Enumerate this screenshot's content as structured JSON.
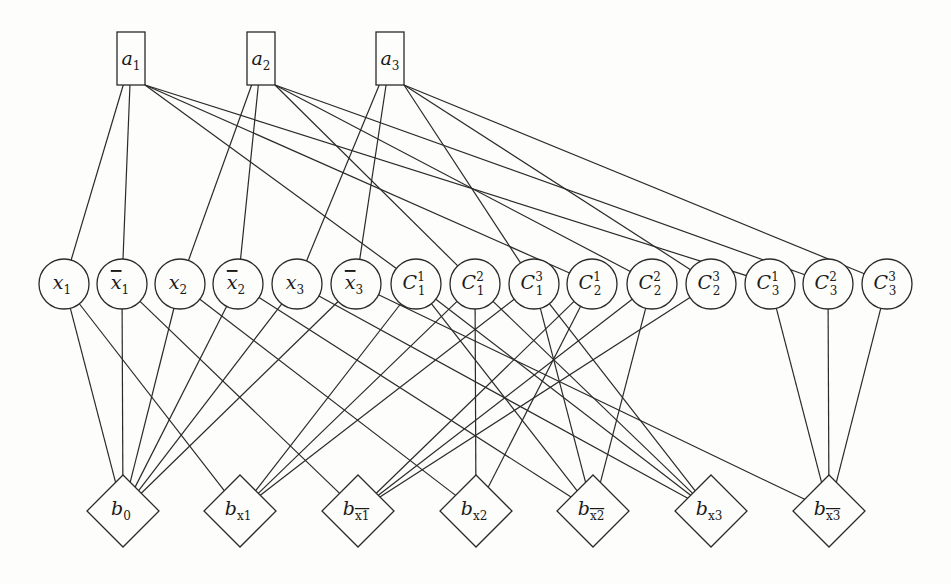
{
  "diagram": {
    "type": "graph",
    "colors": {
      "stroke": "#2a2a2a",
      "background": "#fdfdfb",
      "text": "#1a1a1a"
    },
    "top_nodes": [
      {
        "id": "a1",
        "base": "a",
        "sub": "1",
        "bar": false,
        "x": 131,
        "y": 59
      },
      {
        "id": "a2",
        "base": "a",
        "sub": "2",
        "bar": false,
        "x": 261,
        "y": 59
      },
      {
        "id": "a3",
        "base": "a",
        "sub": "3",
        "bar": false,
        "x": 390,
        "y": 59
      }
    ],
    "middle_nodes": [
      {
        "id": "x1",
        "base": "x",
        "sub": "1",
        "sup": "",
        "bar": false,
        "x": 64
      },
      {
        "id": "nx1",
        "base": "x",
        "sub": "1",
        "sup": "",
        "bar": true,
        "x": 122
      },
      {
        "id": "x2",
        "base": "x",
        "sub": "2",
        "sup": "",
        "bar": false,
        "x": 180
      },
      {
        "id": "nx2",
        "base": "x",
        "sub": "2",
        "sup": "",
        "bar": true,
        "x": 238
      },
      {
        "id": "x3",
        "base": "x",
        "sub": "3",
        "sup": "",
        "bar": false,
        "x": 297
      },
      {
        "id": "nx3",
        "base": "x",
        "sub": "3",
        "sup": "",
        "bar": true,
        "x": 356
      },
      {
        "id": "C11",
        "base": "C",
        "sub": "1",
        "sup": "1",
        "bar": false,
        "x": 416
      },
      {
        "id": "C12",
        "base": "C",
        "sub": "1",
        "sup": "2",
        "bar": false,
        "x": 475
      },
      {
        "id": "C13",
        "base": "C",
        "sub": "1",
        "sup": "3",
        "bar": false,
        "x": 534
      },
      {
        "id": "C21",
        "base": "C",
        "sub": "2",
        "sup": "1",
        "bar": false,
        "x": 592
      },
      {
        "id": "C22",
        "base": "C",
        "sub": "2",
        "sup": "2",
        "bar": false,
        "x": 652
      },
      {
        "id": "C23",
        "base": "C",
        "sub": "2",
        "sup": "3",
        "bar": false,
        "x": 711
      },
      {
        "id": "C31",
        "base": "C",
        "sub": "3",
        "sup": "1",
        "bar": false,
        "x": 770
      },
      {
        "id": "C32",
        "base": "C",
        "sub": "3",
        "sup": "2",
        "bar": false,
        "x": 828
      },
      {
        "id": "C33",
        "base": "C",
        "sub": "3",
        "sup": "3",
        "bar": false,
        "x": 887
      }
    ],
    "middle_y": 284,
    "bottom_nodes": [
      {
        "id": "b0",
        "base": "b",
        "sub": "0",
        "bar": false,
        "x": 123
      },
      {
        "id": "bx1",
        "base": "b",
        "sub": "x1",
        "bar": false,
        "x": 240
      },
      {
        "id": "bnx1",
        "base": "b",
        "sub": "x1",
        "bar": true,
        "x": 358
      },
      {
        "id": "bx2",
        "base": "b",
        "sub": "x2",
        "bar": false,
        "x": 476
      },
      {
        "id": "bnx2",
        "base": "b",
        "sub": "x2",
        "bar": true,
        "x": 593
      },
      {
        "id": "bx3",
        "base": "b",
        "sub": "x3",
        "bar": false,
        "x": 711
      },
      {
        "id": "bnx3",
        "base": "b",
        "sub": "x3",
        "bar": true,
        "x": 829
      }
    ],
    "bottom_y": 511,
    "edges": [
      [
        "a1",
        "x1"
      ],
      [
        "a1",
        "nx1"
      ],
      [
        "a1",
        "C11"
      ],
      [
        "a1",
        "C21"
      ],
      [
        "a1",
        "C31"
      ],
      [
        "a2",
        "x2"
      ],
      [
        "a2",
        "nx2"
      ],
      [
        "a2",
        "C12"
      ],
      [
        "a2",
        "C22"
      ],
      [
        "a2",
        "C32"
      ],
      [
        "a3",
        "x3"
      ],
      [
        "a3",
        "nx3"
      ],
      [
        "a3",
        "C13"
      ],
      [
        "a3",
        "C23"
      ],
      [
        "a3",
        "C33"
      ],
      [
        "x1",
        "b0"
      ],
      [
        "nx1",
        "b0"
      ],
      [
        "x2",
        "b0"
      ],
      [
        "nx2",
        "b0"
      ],
      [
        "x3",
        "b0"
      ],
      [
        "nx3",
        "b0"
      ],
      [
        "x1",
        "bx1"
      ],
      [
        "nx1",
        "bnx1"
      ],
      [
        "x2",
        "bx2"
      ],
      [
        "nx2",
        "bnx2"
      ],
      [
        "x3",
        "bx3"
      ],
      [
        "nx3",
        "bnx3"
      ],
      [
        "C11",
        "bx1"
      ],
      [
        "C12",
        "bx1"
      ],
      [
        "C13",
        "bx1"
      ],
      [
        "C21",
        "bnx1"
      ],
      [
        "C22",
        "bnx1"
      ],
      [
        "C23",
        "bnx1"
      ],
      [
        "C12",
        "bx2"
      ],
      [
        "C21",
        "bx2"
      ],
      [
        "C11",
        "bnx2"
      ],
      [
        "C13",
        "bnx2"
      ],
      [
        "C22",
        "bnx2"
      ],
      [
        "C11",
        "bx3"
      ],
      [
        "C12",
        "bx3"
      ],
      [
        "C13",
        "bx3"
      ],
      [
        "C31",
        "bnx3"
      ],
      [
        "C32",
        "bnx3"
      ],
      [
        "C33",
        "bnx3"
      ]
    ]
  }
}
